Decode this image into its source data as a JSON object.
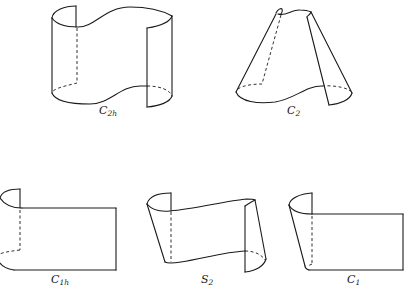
{
  "figure": {
    "panels": [
      {
        "id": "c2h",
        "label_main": "C",
        "label_sub": "2h",
        "shape": "S-shaped cylindrical sheet with two vertical edges"
      },
      {
        "id": "c2",
        "label_main": "C",
        "label_sub": "2",
        "shape": "S-shaped conical sheet"
      },
      {
        "id": "c1h",
        "label_main": "C",
        "label_sub": "1h",
        "shape": "flat sheet with curled left edge"
      },
      {
        "id": "s2",
        "label_main": "S",
        "label_sub": "2",
        "shape": "tilted S-shaped sheet"
      },
      {
        "id": "c1",
        "label_main": "C",
        "label_sub": "1",
        "shape": "flat sheet with tilted curled left edge"
      }
    ]
  }
}
